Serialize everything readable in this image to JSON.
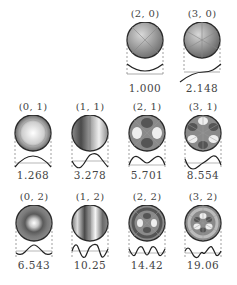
{
  "figure": {
    "modes": [
      {
        "mode": "(2, 0)",
        "value": "1.000",
        "m": 2,
        "n": 0,
        "col": 2,
        "row": 0
      },
      {
        "mode": "(3, 0)",
        "value": "2.148",
        "m": 3,
        "n": 0,
        "col": 3,
        "row": 0
      },
      {
        "mode": "(0, 1)",
        "value": "1.268",
        "m": 0,
        "n": 1,
        "col": 0,
        "row": 1
      },
      {
        "mode": "(1, 1)",
        "value": "3.278",
        "m": 1,
        "n": 1,
        "col": 1,
        "row": 1
      },
      {
        "mode": "(2, 1)",
        "value": "5.701",
        "m": 2,
        "n": 1,
        "col": 2,
        "row": 1
      },
      {
        "mode": "(3, 1)",
        "value": "8.554",
        "m": 3,
        "n": 1,
        "col": 3,
        "row": 1
      },
      {
        "mode": "(0, 2)",
        "value": "6.543",
        "m": 0,
        "n": 2,
        "col": 0,
        "row": 2
      },
      {
        "mode": "(1, 2)",
        "value": "10.25",
        "m": 1,
        "n": 2,
        "col": 1,
        "row": 2
      },
      {
        "mode": "(2, 2)",
        "value": "14.42",
        "m": 2,
        "n": 2,
        "col": 2,
        "row": 2
      },
      {
        "mode": "(3, 2)",
        "value": "19.06",
        "m": 3,
        "n": 2,
        "col": 3,
        "row": 2
      }
    ]
  },
  "colors": {
    "rim": "#2a2a2a",
    "dark": "#5a5a5a",
    "light": "#f4f4f4",
    "dash": "#777777"
  }
}
